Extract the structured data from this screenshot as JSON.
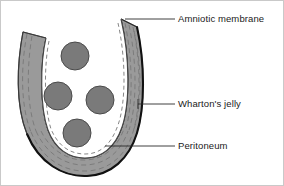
{
  "figure": {
    "background_color": "#ffffff",
    "frame_color": "#c9c9c9"
  },
  "labels": [
    {
      "id": "amniotic-membrane",
      "text": "Amniotic membrane",
      "leader_from": [
        124,
        18
      ],
      "leader_to": [
        174,
        18
      ]
    },
    {
      "id": "whartons-jelly",
      "text": "Wharton's jelly",
      "leader_from": [
        137,
        103
      ],
      "leader_to": [
        174,
        103
      ]
    },
    {
      "id": "peritoneum",
      "text": "Peritoneum",
      "leader_from": [
        104,
        145
      ],
      "leader_to": [
        174,
        145
      ]
    }
  ],
  "structures": {
    "wharton_jelly": {
      "name": "Wharton's jelly",
      "fill_color": "#9a9a9a",
      "outline_color": "#1a1a1a",
      "fiber_color": "#6f6f6f"
    },
    "amniotic_membrane": {
      "name": "Amniotic membrane",
      "stroke_color": "#111111"
    },
    "peritoneum": {
      "name": "Peritoneum",
      "stroke_color": "#444444"
    },
    "lumen": {
      "name": "lumen",
      "fill_color": "#ffffff"
    }
  },
  "vessels": [
    {
      "id": "vessel-top",
      "cx": 74,
      "cy": 55,
      "r": 14,
      "fill": "#7a7a7a",
      "stroke": "#4a4a4a"
    },
    {
      "id": "vessel-left",
      "cx": 57,
      "cy": 95,
      "r": 14,
      "fill": "#7a7a7a",
      "stroke": "#4a4a4a"
    },
    {
      "id": "vessel-right",
      "cx": 99,
      "cy": 99,
      "r": 14,
      "fill": "#7a7a7a",
      "stroke": "#4a4a4a"
    },
    {
      "id": "vessel-bottom",
      "cx": 76,
      "cy": 132,
      "r": 14,
      "fill": "#7a7a7a",
      "stroke": "#4a4a4a"
    }
  ]
}
